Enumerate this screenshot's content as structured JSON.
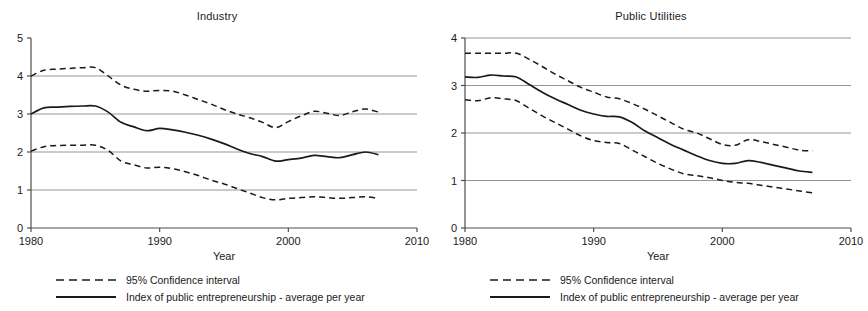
{
  "figure": {
    "legend": {
      "ci_label": "95% Confidence interval",
      "mean_label": "Index of public entrepreneurship - average per year",
      "ci_key_name": "dashed-line-sample",
      "mean_key_name": "solid-line-sample"
    },
    "colors": {
      "line": "#1a1a1a",
      "grid": "#8a8a8a",
      "axis": "#4d4d4d",
      "background": "#ffffff"
    }
  },
  "chart_data": [
    {
      "type": "line",
      "title": "Industry",
      "xlabel": "Year",
      "ylabel": "",
      "xlim": [
        1980,
        2010
      ],
      "ylim": [
        0,
        5
      ],
      "xticks": [
        1980,
        1990,
        2000,
        2010
      ],
      "yticks": [
        0,
        1,
        2,
        3,
        4,
        5
      ],
      "grid": true,
      "gridlines_y": [
        1,
        2,
        3,
        4
      ],
      "legend_position": "below",
      "x": [
        1980,
        1981,
        1982,
        1983,
        1984,
        1985,
        1986,
        1987,
        1988,
        1989,
        1990,
        1991,
        1992,
        1993,
        1994,
        1995,
        1996,
        1997,
        1998,
        1999,
        2000,
        2001,
        2002,
        2003,
        2004,
        2005,
        2006,
        2007
      ],
      "series": [
        {
          "name": "95% Confidence interval - upper",
          "style": "dashed",
          "values": [
            4.0,
            4.15,
            4.18,
            4.2,
            4.22,
            4.22,
            4.0,
            3.76,
            3.65,
            3.6,
            3.62,
            3.6,
            3.5,
            3.38,
            3.26,
            3.12,
            3.0,
            2.9,
            2.78,
            2.64,
            2.8,
            2.95,
            3.07,
            3.02,
            2.96,
            3.06,
            3.13,
            3.05
          ]
        },
        {
          "name": "Index of public entrepreneurship - average per year",
          "style": "solid",
          "values": [
            3.0,
            3.16,
            3.18,
            3.2,
            3.21,
            3.21,
            3.05,
            2.78,
            2.66,
            2.56,
            2.62,
            2.58,
            2.52,
            2.44,
            2.34,
            2.22,
            2.08,
            1.96,
            1.88,
            1.76,
            1.8,
            1.84,
            1.91,
            1.88,
            1.85,
            1.93,
            2.0,
            1.93
          ]
        },
        {
          "name": "95% Confidence interval - lower",
          "style": "dashed",
          "values": [
            2.02,
            2.14,
            2.17,
            2.18,
            2.18,
            2.18,
            2.04,
            1.76,
            1.66,
            1.58,
            1.6,
            1.56,
            1.48,
            1.38,
            1.26,
            1.16,
            1.04,
            0.92,
            0.8,
            0.74,
            0.78,
            0.8,
            0.82,
            0.8,
            0.78,
            0.8,
            0.82,
            0.78
          ]
        }
      ]
    },
    {
      "type": "line",
      "title": "Public Utilities",
      "xlabel": "Year",
      "ylabel": "",
      "xlim": [
        1980,
        2010
      ],
      "ylim": [
        0,
        4
      ],
      "xticks": [
        1980,
        1990,
        2000,
        2010
      ],
      "yticks": [
        0,
        1,
        2,
        3,
        4
      ],
      "grid": true,
      "gridlines_y": [
        1,
        2,
        3,
        4
      ],
      "legend_position": "below",
      "x": [
        1980,
        1981,
        1982,
        1983,
        1984,
        1985,
        1986,
        1987,
        1988,
        1989,
        1990,
        1991,
        1992,
        1993,
        1994,
        1995,
        1996,
        1997,
        1998,
        1999,
        2000,
        2001,
        2002,
        2003,
        2004,
        2005,
        2006,
        2007
      ],
      "series": [
        {
          "name": "95% Confidence interval - upper",
          "style": "dashed",
          "values": [
            3.68,
            3.68,
            3.68,
            3.68,
            3.68,
            3.55,
            3.4,
            3.24,
            3.1,
            2.96,
            2.86,
            2.76,
            2.72,
            2.62,
            2.5,
            2.36,
            2.22,
            2.08,
            2.0,
            1.88,
            1.76,
            1.74,
            1.86,
            1.82,
            1.76,
            1.7,
            1.64,
            1.62
          ]
        },
        {
          "name": "Index of public entrepreneurship - average per year",
          "style": "solid",
          "values": [
            3.18,
            3.17,
            3.22,
            3.2,
            3.18,
            3.02,
            2.86,
            2.72,
            2.6,
            2.48,
            2.4,
            2.35,
            2.34,
            2.22,
            2.04,
            1.9,
            1.76,
            1.64,
            1.52,
            1.42,
            1.36,
            1.36,
            1.42,
            1.38,
            1.32,
            1.26,
            1.2,
            1.17
          ]
        },
        {
          "name": "95% Confidence interval - lower",
          "style": "dashed",
          "values": [
            2.7,
            2.68,
            2.74,
            2.72,
            2.68,
            2.52,
            2.36,
            2.22,
            2.08,
            1.94,
            1.84,
            1.8,
            1.78,
            1.64,
            1.5,
            1.36,
            1.24,
            1.14,
            1.1,
            1.06,
            1.0,
            0.96,
            0.94,
            0.9,
            0.86,
            0.82,
            0.78,
            0.74
          ]
        }
      ]
    }
  ]
}
